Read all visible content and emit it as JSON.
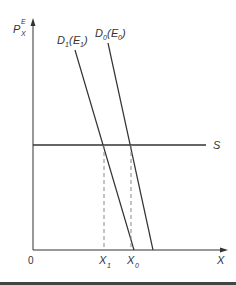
{
  "diagram": {
    "y_axis_label": {
      "main": "P",
      "sup": "E",
      "sub": "X"
    },
    "x_axis_label": "X",
    "origin_label": "0",
    "supply_label": "S",
    "demand_curves": [
      {
        "label_main": "D",
        "label_sub": "1",
        "paren_main": "E",
        "paren_sub": "1"
      },
      {
        "label_main": "D",
        "label_sub": "0",
        "paren_main": "E",
        "paren_sub": "0"
      }
    ],
    "x_ticks": [
      {
        "main": "X",
        "sub": "1"
      },
      {
        "main": "X",
        "sub": "0"
      }
    ],
    "colors": {
      "line": "#333333",
      "dashed": "#888888",
      "bottom_bar": "#444444"
    }
  }
}
